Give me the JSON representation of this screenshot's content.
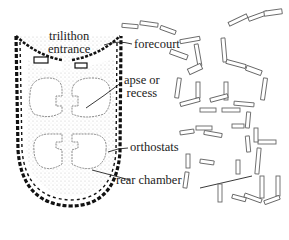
{
  "diagram": {
    "type": "archaeological site plan",
    "labels": [
      {
        "id": "trilithon",
        "lines": [
          "trilithon",
          "entrance"
        ]
      },
      {
        "id": "forecourt",
        "lines": [
          "forecourt"
        ]
      },
      {
        "id": "apse",
        "lines": [
          "apse or",
          "recess"
        ]
      },
      {
        "id": "orthostats",
        "lines": [
          "orthostats"
        ]
      },
      {
        "id": "rear-chamber",
        "lines": [
          "rear chamber"
        ]
      }
    ],
    "colors": {
      "ink": "#222222",
      "stipple": "#bdbdbd",
      "stone_outline": "#666666",
      "background": "#ffffff"
    }
  }
}
